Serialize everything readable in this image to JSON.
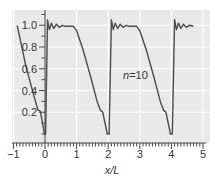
{
  "chart_data": {
    "type": "line",
    "title": "",
    "xlabel": "x/L",
    "ylabel": "",
    "xlim": [
      -1,
      5
    ],
    "ylim": [
      0,
      1.1
    ],
    "x_ticks": [
      "−1",
      "0",
      "1",
      "2",
      "3",
      "4",
      "5"
    ],
    "y_ticks": [
      "0.2",
      "0.4",
      "0.6",
      "0.8",
      "1.0"
    ],
    "grid": true,
    "annotation": {
      "text_italic": "n",
      "text": "=10",
      "x": 2.4,
      "y": 0.55
    },
    "series": [
      {
        "name": "n=10 partial sum (sawtooth)",
        "points": [
          [
            -0.88,
            1.0
          ],
          [
            -0.6,
            0.62
          ],
          [
            -0.35,
            0.35
          ],
          [
            -0.22,
            0.22
          ],
          [
            -0.15,
            0.21
          ],
          [
            -0.08,
            0.1
          ],
          [
            -0.02,
            0.0
          ],
          [
            0.02,
            0.0
          ],
          [
            0.08,
            1.05
          ],
          [
            0.14,
            0.96
          ],
          [
            0.2,
            1.02
          ],
          [
            0.28,
            0.97
          ],
          [
            0.36,
            1.01
          ],
          [
            0.45,
            0.98
          ],
          [
            0.55,
            1.0
          ],
          [
            0.65,
            0.99
          ],
          [
            0.9,
            0.99
          ],
          [
            1.0,
            0.95
          ],
          [
            1.2,
            0.78
          ],
          [
            1.45,
            0.52
          ],
          [
            1.65,
            0.3
          ],
          [
            1.75,
            0.22
          ],
          [
            1.83,
            0.2
          ],
          [
            1.9,
            0.1
          ],
          [
            1.97,
            0.0
          ],
          [
            2.03,
            0.0
          ],
          [
            2.1,
            1.05
          ],
          [
            2.16,
            0.96
          ],
          [
            2.22,
            1.02
          ],
          [
            2.3,
            0.97
          ],
          [
            2.38,
            1.01
          ],
          [
            2.47,
            0.98
          ],
          [
            2.57,
            1.0
          ],
          [
            2.67,
            0.99
          ],
          [
            2.9,
            0.99
          ],
          [
            3.0,
            0.95
          ],
          [
            3.2,
            0.78
          ],
          [
            3.45,
            0.52
          ],
          [
            3.65,
            0.3
          ],
          [
            3.75,
            0.22
          ],
          [
            3.83,
            0.2
          ],
          [
            3.9,
            0.1
          ],
          [
            3.97,
            0.0
          ],
          [
            4.03,
            0.0
          ],
          [
            4.1,
            1.05
          ],
          [
            4.16,
            0.96
          ],
          [
            4.22,
            1.02
          ],
          [
            4.3,
            0.97
          ],
          [
            4.38,
            1.01
          ],
          [
            4.47,
            0.98
          ],
          [
            4.57,
            1.0
          ],
          [
            4.7,
            0.99
          ]
        ]
      }
    ]
  }
}
